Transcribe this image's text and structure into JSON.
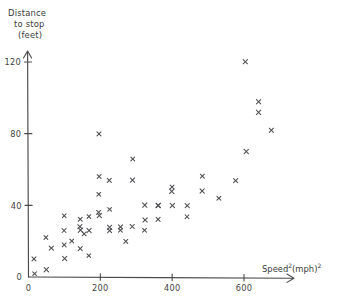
{
  "chart_data": {
    "type": "scatter",
    "title": "",
    "xlabel": "Speed²(mph)²",
    "ylabel": "Distance to stop (feet)",
    "ylabel_lines": [
      "Distance",
      "to stop",
      "(feet)"
    ],
    "xlabel_base": "Speed",
    "xlabel_sup1": "2",
    "xlabel_mid": "(mph)",
    "xlabel_sup2": "2",
    "xlim": [
      0,
      700
    ],
    "ylim": [
      0,
      135
    ],
    "xticks": [
      0,
      200,
      400,
      600
    ],
    "xtick_labels": [
      "0",
      "200",
      "400",
      "600"
    ],
    "yticks": [
      0,
      40,
      80,
      120
    ],
    "ytick_labels": [
      "0",
      "40",
      "80",
      "120"
    ],
    "grid": false,
    "legend": false,
    "marker": "x",
    "marker_color": "#4e4e52",
    "axis_color": "#4a4a4a",
    "n_points": 50,
    "points": [
      [
        16,
        2
      ],
      [
        16,
        10
      ],
      [
        49,
        4
      ],
      [
        49,
        22
      ],
      [
        64,
        16
      ],
      [
        100,
        10
      ],
      [
        100,
        18
      ],
      [
        100,
        26
      ],
      [
        100,
        34
      ],
      [
        121,
        20
      ],
      [
        144,
        16
      ],
      [
        144,
        26
      ],
      [
        144,
        28
      ],
      [
        144,
        32
      ],
      [
        156,
        24
      ],
      [
        169,
        12
      ],
      [
        169,
        26
      ],
      [
        169,
        34
      ],
      [
        196,
        34
      ],
      [
        196,
        36
      ],
      [
        196,
        46
      ],
      [
        196,
        56
      ],
      [
        196,
        80
      ],
      [
        225,
        26
      ],
      [
        225,
        28
      ],
      [
        225,
        38
      ],
      [
        225,
        54
      ],
      [
        256,
        26
      ],
      [
        256,
        28
      ],
      [
        272,
        20
      ],
      [
        289,
        28
      ],
      [
        289,
        54
      ],
      [
        289,
        66
      ],
      [
        324,
        26
      ],
      [
        324,
        32
      ],
      [
        324,
        40
      ],
      [
        361,
        32
      ],
      [
        361,
        40
      ],
      [
        361,
        40
      ],
      [
        400,
        40
      ],
      [
        400,
        48
      ],
      [
        400,
        50
      ],
      [
        441,
        34
      ],
      [
        441,
        40
      ],
      [
        484,
        48
      ],
      [
        484,
        56
      ],
      [
        529,
        44
      ],
      [
        576,
        54
      ],
      [
        605,
        70
      ],
      [
        605,
        120
      ],
      [
        640,
        92
      ],
      [
        640,
        98
      ],
      [
        676,
        82
      ]
    ]
  }
}
